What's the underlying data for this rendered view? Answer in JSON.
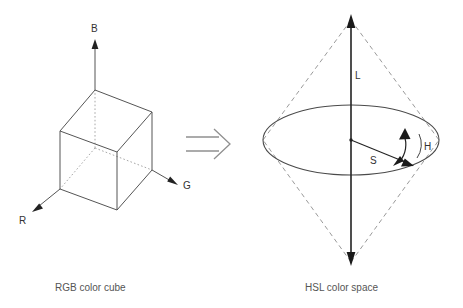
{
  "figure": {
    "background_color": "#ffffff",
    "line_color": "#555555",
    "solid_color": "#222222",
    "dashed_color": "#8a8a8a",
    "dotted_color": "#9a9a9a",
    "text_color": "#333333"
  },
  "left_diagram": {
    "caption": "RGB color cube",
    "axes": [
      {
        "label": "B",
        "name": "blue-axis",
        "direction": "up"
      },
      {
        "label": "G",
        "name": "green-axis",
        "direction": "right-down"
      },
      {
        "label": "R",
        "name": "red-axis",
        "direction": "left-down"
      }
    ]
  },
  "transform_arrow": {
    "glyph": "double-arrow-right",
    "name": "transform-arrow"
  },
  "right_diagram": {
    "caption": "HSL color space",
    "labels": [
      {
        "label": "L",
        "name": "lightness-axis-label",
        "meaning": "Lightness"
      },
      {
        "label": "S",
        "name": "saturation-radius-label",
        "meaning": "Saturation"
      },
      {
        "label": "H",
        "name": "hue-angle-label",
        "meaning": "Hue"
      }
    ]
  }
}
